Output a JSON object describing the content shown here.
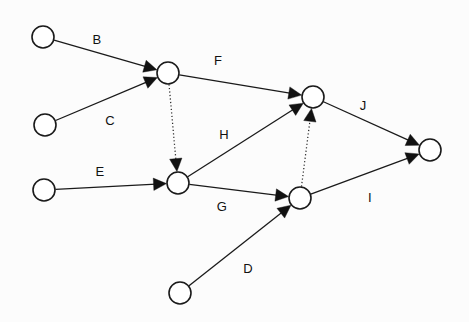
{
  "diagram": {
    "type": "directed-graph",
    "title": "",
    "background_color": "#fcfcfc",
    "stroke_color": "#111111",
    "node_fill_color": "#ffffff",
    "node_radius": 11,
    "nodes": [
      {
        "id": "n1",
        "label": "",
        "cx": 43,
        "cy": 37
      },
      {
        "id": "n2",
        "label": "",
        "cx": 45,
        "cy": 125
      },
      {
        "id": "n3",
        "label": "",
        "cx": 44,
        "cy": 190
      },
      {
        "id": "n4",
        "label": "",
        "cx": 168,
        "cy": 73
      },
      {
        "id": "n5",
        "label": "",
        "cx": 178,
        "cy": 183
      },
      {
        "id": "n6",
        "label": "",
        "cx": 313,
        "cy": 97
      },
      {
        "id": "n7",
        "label": "",
        "cx": 300,
        "cy": 198
      },
      {
        "id": "n8",
        "label": "",
        "cx": 430,
        "cy": 150
      },
      {
        "id": "n9",
        "label": "",
        "cx": 180,
        "cy": 293
      }
    ],
    "edges": [
      {
        "id": "eB",
        "label": "B",
        "from": "n1",
        "to": "n4",
        "style": "solid",
        "label_x": 97,
        "label_y": 41
      },
      {
        "id": "eC",
        "label": "C",
        "from": "n2",
        "to": "n4",
        "style": "solid",
        "label_x": 110,
        "label_y": 122
      },
      {
        "id": "eF",
        "label": "F",
        "from": "n4",
        "to": "n6",
        "style": "solid",
        "label_x": 218,
        "label_y": 62
      },
      {
        "id": "eFD",
        "label": "",
        "from": "n4",
        "to": "n5",
        "style": "dotted",
        "label_x": 0,
        "label_y": 0
      },
      {
        "id": "eE",
        "label": "E",
        "from": "n3",
        "to": "n5",
        "style": "solid",
        "label_x": 100,
        "label_y": 173
      },
      {
        "id": "eH",
        "label": "H",
        "from": "n5",
        "to": "n6",
        "style": "solid",
        "label_x": 224,
        "label_y": 136
      },
      {
        "id": "eG",
        "label": "G",
        "from": "n5",
        "to": "n7",
        "style": "solid",
        "label_x": 222,
        "label_y": 208
      },
      {
        "id": "eD",
        "label": "D",
        "from": "n9",
        "to": "n7",
        "style": "solid",
        "label_x": 248,
        "label_y": 270
      },
      {
        "id": "eI",
        "label": "I",
        "from": "n7",
        "to": "n8",
        "style": "solid",
        "label_x": 370,
        "label_y": 199
      },
      {
        "id": "eJ",
        "label": "J",
        "from": "n6",
        "to": "n8",
        "style": "solid",
        "label_x": 363,
        "label_y": 107
      },
      {
        "id": "eID",
        "label": "",
        "from": "n7",
        "to": "n6",
        "style": "dotted",
        "label_x": 0,
        "label_y": 0
      }
    ]
  }
}
